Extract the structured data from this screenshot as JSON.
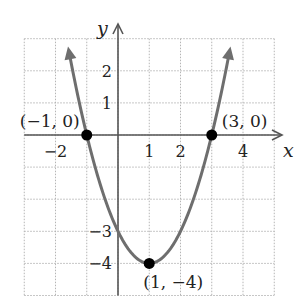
{
  "chart_data": {
    "type": "line",
    "title": "",
    "xlabel": "x",
    "ylabel": "y",
    "xlim": [
      -3,
      5
    ],
    "ylim": [
      -5,
      3
    ],
    "grid": true,
    "x_ticks": [
      {
        "value": -2,
        "label": "−2"
      },
      {
        "value": 1,
        "label": "1"
      },
      {
        "value": 2,
        "label": "2"
      },
      {
        "value": 4,
        "label": "4"
      }
    ],
    "y_ticks": [
      {
        "value": 2,
        "label": "2"
      },
      {
        "value": 1,
        "label": "1"
      },
      {
        "value": -3,
        "label": "−3"
      },
      {
        "value": -4,
        "label": "−4"
      }
    ],
    "series": [
      {
        "name": "y = (x − 1)² − 4",
        "function": "x^2 - 2x - 3",
        "x_range": [
          -1.55,
          3.55
        ],
        "color": "#6e6e6e"
      }
    ],
    "points": [
      {
        "x": -1,
        "y": 0,
        "label": "(−1, 0)"
      },
      {
        "x": 3,
        "y": 0,
        "label": "(3, 0)"
      },
      {
        "x": 1,
        "y": -4,
        "label": "(1, −4)"
      }
    ],
    "colors": {
      "axis": "#555555",
      "grid": "#b5b5b5",
      "curve": "#6e6e6e",
      "point": "#000000"
    }
  }
}
